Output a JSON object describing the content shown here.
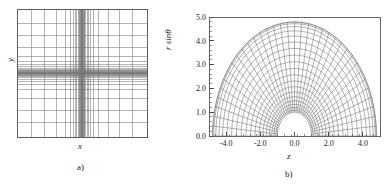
{
  "figure": {
    "panels": [
      {
        "id": "a",
        "caption": "a)",
        "xlabel": "x",
        "ylabel": "y",
        "grid_type": "cartesian-clustered"
      },
      {
        "id": "b",
        "caption": "b)",
        "xlabel": "z",
        "ylabel": "r sinθ",
        "grid_type": "polar-semicircular"
      }
    ]
  },
  "chart_data": [
    {
      "type": "line",
      "id": "panel-a-mesh",
      "title": "",
      "subtitle": "",
      "xlabel": "x",
      "ylabel": "y",
      "caption": "a)",
      "grid": true,
      "legend": "none",
      "description": "Cartesian structured mesh with strong grid-line clustering toward the centre of the domain in both x and y directions.",
      "xlim": [
        -1,
        1
      ],
      "ylim": [
        -1,
        1
      ],
      "xticks": [],
      "yticks": [],
      "xticklabels": [],
      "yticklabels": [],
      "grid_lines_x": [
        -1.0,
        -0.78,
        -0.58,
        -0.4,
        -0.26,
        -0.175,
        -0.13,
        -0.1,
        -0.078,
        -0.06,
        -0.046,
        -0.035,
        -0.026,
        -0.019,
        -0.0135,
        -0.009,
        -0.0055,
        -0.0025,
        0.0,
        0.0025,
        0.0055,
        0.009,
        0.0135,
        0.019,
        0.026,
        0.035,
        0.046,
        0.06,
        0.078,
        0.1,
        0.13,
        0.175,
        0.26,
        0.4,
        0.58,
        0.78,
        1.0
      ],
      "grid_lines_y": [
        -1.0,
        -0.78,
        -0.58,
        -0.4,
        -0.26,
        -0.175,
        -0.13,
        -0.1,
        -0.078,
        -0.06,
        -0.046,
        -0.035,
        -0.026,
        -0.019,
        -0.0135,
        -0.009,
        -0.0055,
        -0.0025,
        0.0,
        0.0025,
        0.0055,
        0.009,
        0.0135,
        0.019,
        0.026,
        0.035,
        0.046,
        0.06,
        0.078,
        0.1,
        0.13,
        0.175,
        0.26,
        0.4,
        0.58,
        0.78,
        1.0
      ],
      "n_lines_x": 37,
      "n_lines_y": 37,
      "line_color": "#777777"
    },
    {
      "type": "line",
      "id": "panel-b-mesh",
      "title": "",
      "subtitle": "",
      "xlabel": "z",
      "ylabel": "r sinθ",
      "caption": "b)",
      "grid": true,
      "legend": "none",
      "description": "Semicircular (polar) structured mesh spanning theta from 0 to 180 degrees, with an inner circular hole of radius 1.0 and an outer boundary at radius 4.8. Radial lines are clustered toward the inner boundary.",
      "xlim": [
        -5.0,
        5.0
      ],
      "ylim": [
        0.0,
        5.0
      ],
      "xticks": [
        -4.0,
        -2.0,
        0.0,
        2.0,
        4.0
      ],
      "yticks": [
        0.0,
        1.0,
        2.0,
        3.0,
        4.0,
        5.0
      ],
      "xticklabels": [
        "-4.0",
        "-2.0",
        "0.0",
        "2.0",
        "4.0"
      ],
      "yticklabels": [
        "0.0",
        "1.0",
        "2.0",
        "3.0",
        "4.0",
        "5.0"
      ],
      "x_minor_ticks_per_major": 5,
      "y_minor_ticks_per_major": 5,
      "r_inner": 1.0,
      "r_outer": 4.8,
      "theta_start_deg": 0,
      "theta_end_deg": 180,
      "n_radial_rings": 21,
      "n_angular_lines": 37,
      "radial_rings": [
        1.0,
        1.09,
        1.2,
        1.33,
        1.48,
        1.65,
        1.85,
        2.07,
        2.31,
        2.57,
        2.84,
        3.12,
        3.4,
        3.68,
        3.95,
        4.2,
        4.42,
        4.6,
        4.72,
        4.78,
        4.8
      ],
      "line_color": "#666666"
    }
  ]
}
